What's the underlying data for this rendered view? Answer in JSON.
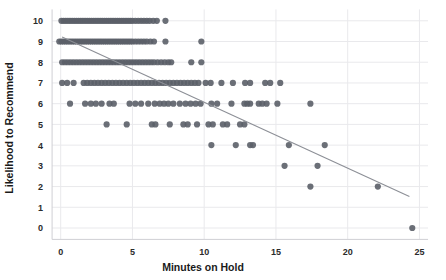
{
  "chart_data": {
    "type": "scatter",
    "title": "",
    "xlabel": "Minutes on Hold",
    "ylabel": "Likelihood to Recommend",
    "xlim": [
      -0.6,
      25.6
    ],
    "ylim": [
      -0.55,
      10.55
    ],
    "xticks": [
      0,
      5,
      10,
      15,
      20,
      25
    ],
    "xtick_labels": [
      "0",
      "5",
      "10",
      "15",
      "20",
      "25"
    ],
    "yticks": [
      0,
      1,
      2,
      3,
      4,
      5,
      6,
      7,
      8,
      9,
      10
    ],
    "ytick_labels": [
      "0",
      "1",
      "2",
      "3",
      "4",
      "5",
      "6",
      "7",
      "8",
      "9",
      "10"
    ],
    "grid": true,
    "grid_color": "#e9e9ec",
    "legend": "none",
    "point_color": "#5b5f68",
    "point_opacity": 0.9,
    "point_radius": 3.1,
    "trendline": {
      "color": "#8c8f96",
      "width": 1.1,
      "x_start": 0.1,
      "y_start": 9.22,
      "x_end": 24.3,
      "y_end": 1.52
    },
    "points": [
      [
        0.05,
        10
      ],
      [
        0.2,
        10
      ],
      [
        0.35,
        10
      ],
      [
        0.5,
        10
      ],
      [
        0.65,
        10
      ],
      [
        0.8,
        10
      ],
      [
        0.95,
        10
      ],
      [
        1.1,
        10
      ],
      [
        1.25,
        10
      ],
      [
        1.4,
        10
      ],
      [
        1.55,
        10
      ],
      [
        1.7,
        10
      ],
      [
        1.85,
        10
      ],
      [
        2.0,
        10
      ],
      [
        2.15,
        10
      ],
      [
        2.3,
        10
      ],
      [
        2.45,
        10
      ],
      [
        2.6,
        10
      ],
      [
        2.75,
        10
      ],
      [
        2.9,
        10
      ],
      [
        3.05,
        10
      ],
      [
        3.2,
        10
      ],
      [
        3.35,
        10
      ],
      [
        3.5,
        10
      ],
      [
        3.65,
        10
      ],
      [
        3.8,
        10
      ],
      [
        3.95,
        10
      ],
      [
        4.1,
        10
      ],
      [
        4.25,
        10
      ],
      [
        4.4,
        10
      ],
      [
        4.55,
        10
      ],
      [
        4.7,
        10
      ],
      [
        4.85,
        10
      ],
      [
        5.0,
        10
      ],
      [
        5.2,
        10
      ],
      [
        5.4,
        10
      ],
      [
        5.6,
        10
      ],
      [
        5.8,
        10
      ],
      [
        6.0,
        10
      ],
      [
        6.2,
        10
      ],
      [
        6.45,
        10
      ],
      [
        6.7,
        10
      ],
      [
        7.3,
        10
      ],
      [
        -0.1,
        9
      ],
      [
        0.05,
        9
      ],
      [
        0.2,
        9
      ],
      [
        0.35,
        9
      ],
      [
        0.5,
        9
      ],
      [
        0.65,
        9
      ],
      [
        0.8,
        9
      ],
      [
        0.95,
        9
      ],
      [
        1.1,
        9
      ],
      [
        1.25,
        9
      ],
      [
        1.4,
        9
      ],
      [
        1.55,
        9
      ],
      [
        1.7,
        9
      ],
      [
        1.85,
        9
      ],
      [
        2.0,
        9
      ],
      [
        2.15,
        9
      ],
      [
        2.3,
        9
      ],
      [
        2.45,
        9
      ],
      [
        2.6,
        9
      ],
      [
        2.75,
        9
      ],
      [
        2.9,
        9
      ],
      [
        3.05,
        9
      ],
      [
        3.2,
        9
      ],
      [
        3.35,
        9
      ],
      [
        3.5,
        9
      ],
      [
        3.65,
        9
      ],
      [
        3.8,
        9
      ],
      [
        3.95,
        9
      ],
      [
        4.1,
        9
      ],
      [
        4.25,
        9
      ],
      [
        4.4,
        9
      ],
      [
        4.55,
        9
      ],
      [
        4.7,
        9
      ],
      [
        4.85,
        9
      ],
      [
        5.0,
        9
      ],
      [
        5.2,
        9
      ],
      [
        5.4,
        9
      ],
      [
        5.6,
        9
      ],
      [
        5.8,
        9
      ],
      [
        6.0,
        9
      ],
      [
        6.25,
        9
      ],
      [
        6.5,
        9
      ],
      [
        7.3,
        9
      ],
      [
        9.8,
        9
      ],
      [
        0.1,
        8
      ],
      [
        0.3,
        8
      ],
      [
        0.5,
        8
      ],
      [
        0.7,
        8
      ],
      [
        0.9,
        8
      ],
      [
        1.1,
        8
      ],
      [
        1.3,
        8
      ],
      [
        1.5,
        8
      ],
      [
        1.7,
        8
      ],
      [
        1.9,
        8
      ],
      [
        2.1,
        8
      ],
      [
        2.3,
        8
      ],
      [
        2.5,
        8
      ],
      [
        2.7,
        8
      ],
      [
        2.9,
        8
      ],
      [
        3.1,
        8
      ],
      [
        3.3,
        8
      ],
      [
        3.5,
        8
      ],
      [
        3.7,
        8
      ],
      [
        3.9,
        8
      ],
      [
        4.1,
        8
      ],
      [
        4.3,
        8
      ],
      [
        4.5,
        8
      ],
      [
        4.7,
        8
      ],
      [
        4.9,
        8
      ],
      [
        5.1,
        8
      ],
      [
        5.3,
        8
      ],
      [
        5.5,
        8
      ],
      [
        5.7,
        8
      ],
      [
        5.9,
        8
      ],
      [
        6.1,
        8
      ],
      [
        6.3,
        8
      ],
      [
        6.5,
        8
      ],
      [
        6.75,
        8
      ],
      [
        7.0,
        8
      ],
      [
        7.25,
        8
      ],
      [
        7.5,
        8
      ],
      [
        7.7,
        8
      ],
      [
        9.1,
        8
      ],
      [
        9.8,
        8
      ],
      [
        0.1,
        7
      ],
      [
        0.45,
        7
      ],
      [
        0.9,
        7
      ],
      [
        1.6,
        7
      ],
      [
        1.85,
        7
      ],
      [
        2.1,
        7
      ],
      [
        2.35,
        7
      ],
      [
        2.6,
        7
      ],
      [
        2.85,
        7
      ],
      [
        3.1,
        7
      ],
      [
        3.35,
        7
      ],
      [
        3.6,
        7
      ],
      [
        3.85,
        7
      ],
      [
        4.1,
        7
      ],
      [
        4.35,
        7
      ],
      [
        4.6,
        7
      ],
      [
        4.85,
        7
      ],
      [
        5.1,
        7
      ],
      [
        5.35,
        7
      ],
      [
        5.6,
        7
      ],
      [
        5.85,
        7
      ],
      [
        6.1,
        7
      ],
      [
        6.35,
        7
      ],
      [
        6.6,
        7
      ],
      [
        6.85,
        7
      ],
      [
        7.1,
        7
      ],
      [
        7.35,
        7
      ],
      [
        7.6,
        7
      ],
      [
        7.85,
        7
      ],
      [
        8.1,
        7
      ],
      [
        8.35,
        7
      ],
      [
        8.6,
        7
      ],
      [
        8.85,
        7
      ],
      [
        9.1,
        7
      ],
      [
        9.35,
        7
      ],
      [
        9.6,
        7
      ],
      [
        10.1,
        7
      ],
      [
        10.45,
        7
      ],
      [
        11.2,
        7
      ],
      [
        12.0,
        7
      ],
      [
        12.85,
        7
      ],
      [
        13.2,
        7
      ],
      [
        14.25,
        7
      ],
      [
        14.6,
        7
      ],
      [
        15.3,
        7
      ],
      [
        0.65,
        6
      ],
      [
        1.7,
        6
      ],
      [
        2.1,
        6
      ],
      [
        2.45,
        6
      ],
      [
        2.85,
        6
      ],
      [
        3.4,
        6
      ],
      [
        3.7,
        6
      ],
      [
        4.8,
        6
      ],
      [
        5.2,
        6
      ],
      [
        5.6,
        6
      ],
      [
        6.1,
        6
      ],
      [
        6.55,
        6
      ],
      [
        6.9,
        6
      ],
      [
        7.2,
        6
      ],
      [
        7.5,
        6
      ],
      [
        7.85,
        6
      ],
      [
        8.3,
        6
      ],
      [
        8.7,
        6
      ],
      [
        9.05,
        6
      ],
      [
        9.4,
        6
      ],
      [
        9.75,
        6
      ],
      [
        10.5,
        6
      ],
      [
        10.9,
        6
      ],
      [
        11.9,
        6
      ],
      [
        12.8,
        6
      ],
      [
        13.0,
        6
      ],
      [
        13.2,
        6
      ],
      [
        13.8,
        6
      ],
      [
        14.05,
        6
      ],
      [
        14.35,
        6
      ],
      [
        15.1,
        6
      ],
      [
        17.4,
        6
      ],
      [
        3.2,
        5
      ],
      [
        4.6,
        5
      ],
      [
        6.35,
        5
      ],
      [
        6.6,
        5
      ],
      [
        7.6,
        5
      ],
      [
        8.55,
        5
      ],
      [
        8.85,
        5
      ],
      [
        9.5,
        5
      ],
      [
        10.3,
        5
      ],
      [
        10.6,
        5
      ],
      [
        11.3,
        5
      ],
      [
        11.6,
        5
      ],
      [
        12.5,
        5
      ],
      [
        12.8,
        5
      ],
      [
        10.5,
        4
      ],
      [
        12.2,
        4
      ],
      [
        13.2,
        4
      ],
      [
        13.4,
        4
      ],
      [
        15.9,
        4
      ],
      [
        18.4,
        4
      ],
      [
        15.6,
        3
      ],
      [
        17.9,
        3
      ],
      [
        17.4,
        2
      ],
      [
        22.1,
        2
      ],
      [
        24.5,
        0
      ]
    ]
  }
}
